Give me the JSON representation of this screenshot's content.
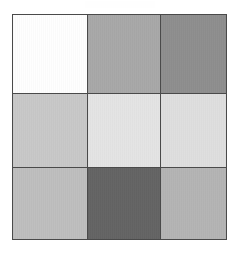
{
  "figure": {
    "title": "",
    "background_color": "#ffffff",
    "width": 239,
    "height": 254
  },
  "grid": {
    "name": "grayscale-patch-grid",
    "rows": 3,
    "columns": 3,
    "border_color": "#4a4a4a",
    "border_width_px": 1,
    "gridline_color": "#4a4a4a",
    "gridline_width_px": 1,
    "left_px": 12,
    "top_px": 14,
    "width_px": 215,
    "height_px": 226,
    "cells": [
      {
        "row": 1,
        "col": 1,
        "label": "r1c1",
        "color": "#fefefe",
        "tone": "white"
      },
      {
        "row": 1,
        "col": 2,
        "label": "r1c2",
        "color": "#a8a8a8",
        "tone": "medium-gray"
      },
      {
        "row": 1,
        "col": 3,
        "label": "r1c3",
        "color": "#8e8e8e",
        "tone": "dark-medium-gray"
      },
      {
        "row": 2,
        "col": 1,
        "label": "r2c1",
        "color": "#c8c8c8",
        "tone": "light-gray"
      },
      {
        "row": 2,
        "col": 2,
        "label": "r2c2",
        "color": "#e4e4e4",
        "tone": "very-light-gray"
      },
      {
        "row": 2,
        "col": 3,
        "label": "r2c3",
        "color": "#dedede",
        "tone": "very-light-gray"
      },
      {
        "row": 3,
        "col": 1,
        "label": "r3c1",
        "color": "#bebebe",
        "tone": "light-medium-gray"
      },
      {
        "row": 3,
        "col": 2,
        "label": "r3c2",
        "color": "#646464",
        "tone": "dark-gray"
      },
      {
        "row": 3,
        "col": 3,
        "label": "r3c3",
        "color": "#b4b4b4",
        "tone": "medium-light-gray"
      }
    ]
  },
  "chart_data": {
    "type": "heatmap",
    "title": "",
    "subtitle": "",
    "xlabel": "",
    "ylabel": "",
    "grid": true,
    "legend": "none",
    "colorscale": "grayscale",
    "x": [
      "1",
      "2",
      "3"
    ],
    "y": [
      "1",
      "2",
      "3"
    ],
    "values": [
      [
        254,
        168,
        142
      ],
      [
        200,
        228,
        222
      ],
      [
        190,
        100,
        180
      ]
    ],
    "value_range": [
      0,
      255
    ],
    "cell_colors": [
      [
        "#fefefe",
        "#a8a8a8",
        "#8e8e8e"
      ],
      [
        "#c8c8c8",
        "#e4e4e4",
        "#dedede"
      ],
      [
        "#bebebe",
        "#646464",
        "#b4b4b4"
      ]
    ],
    "annotations": []
  }
}
